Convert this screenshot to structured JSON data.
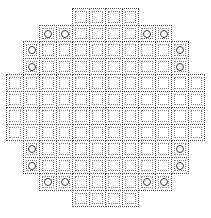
{
  "diagram": {
    "title": "",
    "type": "core-map-grid",
    "cell_size": 16.5,
    "origin": {
      "x": 6,
      "y": 8
    },
    "line_color": "#555555",
    "circle_color": "#444444",
    "rows": [
      {
        "row": 0,
        "cols": [
          4,
          5,
          6,
          7
        ],
        "circles": []
      },
      {
        "row": 1,
        "cols": [
          2,
          3,
          4,
          5,
          6,
          7,
          8,
          9
        ],
        "circles": [
          2,
          3,
          8,
          9
        ]
      },
      {
        "row": 2,
        "cols": [
          1,
          2,
          3,
          4,
          5,
          6,
          7,
          8,
          9,
          10
        ],
        "circles": [
          1,
          10
        ]
      },
      {
        "row": 3,
        "cols": [
          1,
          2,
          3,
          4,
          5,
          6,
          7,
          8,
          9,
          10
        ],
        "circles": [
          1,
          10
        ]
      },
      {
        "row": 4,
        "cols": [
          0,
          1,
          2,
          3,
          4,
          5,
          6,
          7,
          8,
          9,
          10,
          11
        ],
        "circles": []
      },
      {
        "row": 5,
        "cols": [
          0,
          1,
          2,
          3,
          4,
          5,
          6,
          7,
          8,
          9,
          10,
          11
        ],
        "circles": []
      },
      {
        "row": 6,
        "cols": [
          0,
          1,
          2,
          3,
          4,
          5,
          6,
          7,
          8,
          9,
          10,
          11
        ],
        "circles": []
      },
      {
        "row": 7,
        "cols": [
          0,
          1,
          2,
          3,
          4,
          5,
          6,
          7,
          8,
          9,
          10,
          11
        ],
        "circles": []
      },
      {
        "row": 8,
        "cols": [
          1,
          2,
          3,
          4,
          5,
          6,
          7,
          8,
          9,
          10
        ],
        "circles": [
          1,
          10
        ]
      },
      {
        "row": 9,
        "cols": [
          1,
          2,
          3,
          4,
          5,
          6,
          7,
          8,
          9,
          10
        ],
        "circles": [
          1,
          10
        ]
      },
      {
        "row": 10,
        "cols": [
          2,
          3,
          4,
          5,
          6,
          7,
          8,
          9
        ],
        "circles": [
          2,
          3,
          8,
          9
        ]
      },
      {
        "row": 11,
        "cols": [
          4,
          5,
          6,
          7
        ],
        "circles": []
      }
    ]
  }
}
